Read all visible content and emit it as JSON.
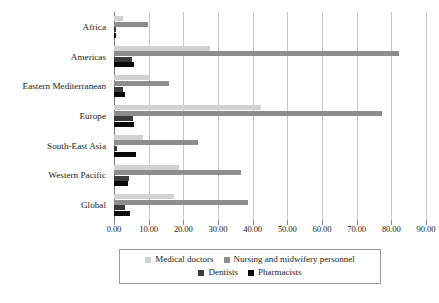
{
  "chart_data": {
    "type": "bar",
    "orientation": "horizontal",
    "title": "",
    "subtitle": "",
    "xlabel": "",
    "ylabel": "",
    "xlim": [
      0,
      90
    ],
    "xticks": [
      0,
      10,
      20,
      30,
      40,
      50,
      60,
      70,
      80,
      90
    ],
    "xtick_labels": [
      "0.00",
      "10.00",
      "20.00",
      "30.00",
      "40.00",
      "50.00",
      "60.00",
      "70.00",
      "80.00",
      "90.00"
    ],
    "grid": true,
    "legend_position": "bottom",
    "categories": [
      "Africa",
      "Americas",
      "Eastern Mediterranean",
      "Europe",
      "South-East Asia",
      "Western Pacific",
      "Global"
    ],
    "series": [
      {
        "name": "Medical doctors",
        "color": "#d2d2d2",
        "values": [
          2.7,
          27.8,
          10.5,
          42.5,
          8.5,
          18.7,
          17.3
        ]
      },
      {
        "name": "Nursing and midwifery personnel",
        "color": "#8d8d8d",
        "values": [
          9.8,
          82.2,
          15.8,
          77.4,
          24.1,
          36.6,
          38.6
        ]
      },
      {
        "name": "Dentists",
        "color": "#3b3b3b",
        "values": [
          0.5,
          5.3,
          2.6,
          5.5,
          1.0,
          4.3,
          3.3
        ]
      },
      {
        "name": "Pharmacists",
        "color": "#0a0a0a",
        "values": [
          0.7,
          5.7,
          3.1,
          5.8,
          6.3,
          4.1,
          4.5
        ]
      }
    ]
  }
}
